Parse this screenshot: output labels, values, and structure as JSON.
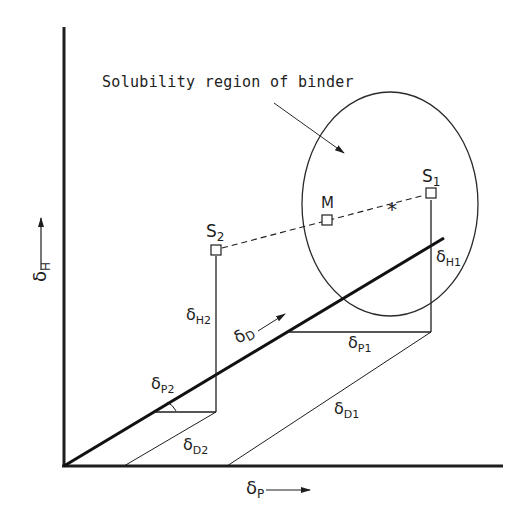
{
  "diagram": {
    "type": "hansen-solubility-parameter-diagram",
    "annotation": "Solubility region of binder",
    "axes": {
      "x": {
        "symbol": "δ",
        "subscript": "P"
      },
      "y": {
        "symbol": "δ",
        "subscript": "H"
      }
    },
    "points": [
      {
        "id": "S1",
        "label": "S",
        "subscript": "1"
      },
      {
        "id": "S2",
        "label": "S",
        "subscript": "2"
      },
      {
        "id": "M",
        "label": "M"
      }
    ],
    "labels": {
      "dD": {
        "symbol": "δ",
        "subscript": "D"
      },
      "dH1": {
        "symbol": "δ",
        "subscript": "H1"
      },
      "dH2": {
        "symbol": "δ",
        "subscript": "H2"
      },
      "dP1": {
        "symbol": "δ",
        "subscript": "P1"
      },
      "dP2": {
        "symbol": "δ",
        "subscript": "P2"
      },
      "dD1": {
        "symbol": "δ",
        "subscript": "D1"
      },
      "dD2": {
        "symbol": "δ",
        "subscript": "D2"
      }
    },
    "markers": {
      "mixture_star": "*"
    },
    "colors": {
      "ink": "#1e1e1e",
      "background": "#ffffff"
    }
  }
}
